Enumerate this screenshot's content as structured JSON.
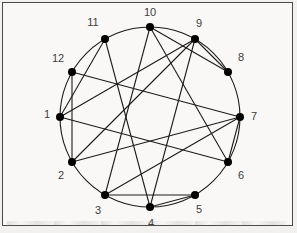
{
  "figure": {
    "type": "circular-graph",
    "colors": {
      "background": "#f9f8f6",
      "frame_border": "#4a4a4a",
      "edge_line": "#1c1c1c",
      "circle_line": "#1c1c1c",
      "node_fill": "#000000",
      "label_text": "#3c3c3c"
    },
    "center": {
      "x": 149,
      "y": 116
    },
    "radius": 90,
    "node_radius": 4,
    "line_width": 1.1,
    "nodes": [
      {
        "id": "1",
        "label": "1",
        "x": 59,
        "y": 116,
        "lx": 46,
        "ly": 114
      },
      {
        "id": "2",
        "label": "2",
        "x": 71,
        "y": 161,
        "lx": 60,
        "ly": 175
      },
      {
        "id": "3",
        "label": "3",
        "x": 104,
        "y": 194,
        "lx": 97,
        "ly": 210
      },
      {
        "id": "4",
        "label": "4",
        "x": 149,
        "y": 206,
        "lx": 150,
        "ly": 223
      },
      {
        "id": "5",
        "label": "5",
        "x": 194,
        "y": 194,
        "lx": 198,
        "ly": 209
      },
      {
        "id": "6",
        "label": "6",
        "x": 227,
        "y": 161,
        "lx": 240,
        "ly": 175
      },
      {
        "id": "7",
        "label": "7",
        "x": 239,
        "y": 116,
        "lx": 253,
        "ly": 116
      },
      {
        "id": "8",
        "label": "8",
        "x": 227,
        "y": 71,
        "lx": 240,
        "ly": 57
      },
      {
        "id": "9",
        "label": "9",
        "x": 194,
        "y": 38,
        "lx": 198,
        "ly": 23
      },
      {
        "id": "10",
        "label": "10",
        "x": 149,
        "y": 26,
        "lx": 149,
        "ly": 12
      },
      {
        "id": "11",
        "label": "11",
        "x": 104,
        "y": 38,
        "lx": 92,
        "ly": 22
      },
      {
        "id": "12",
        "label": "12",
        "x": 71,
        "y": 71,
        "lx": 57,
        "ly": 58
      }
    ],
    "edges": [
      [
        "1",
        "6"
      ],
      [
        "1",
        "9"
      ],
      [
        "1",
        "11"
      ],
      [
        "2",
        "7"
      ],
      [
        "2",
        "9"
      ],
      [
        "2",
        "12"
      ],
      [
        "3",
        "5"
      ],
      [
        "3",
        "7"
      ],
      [
        "3",
        "10"
      ],
      [
        "4",
        "5"
      ],
      [
        "4",
        "9"
      ],
      [
        "4",
        "11"
      ],
      [
        "6",
        "7"
      ],
      [
        "6",
        "10"
      ],
      [
        "7",
        "12"
      ],
      [
        "8",
        "9"
      ],
      [
        "8",
        "10"
      ]
    ]
  }
}
